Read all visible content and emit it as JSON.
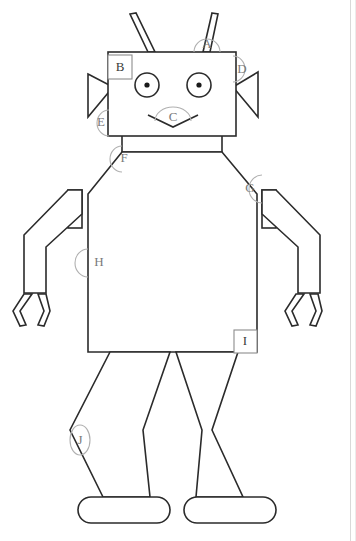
{
  "diagram": {
    "stroke_color": "#2b2b2b",
    "marker_color": "#7a7a7a",
    "background": "#ffffff",
    "markers": [
      {
        "id": "A",
        "label": "A",
        "shape": "semicircle",
        "part": "antenna",
        "cx": 207,
        "cy": 45,
        "r": 13
      },
      {
        "id": "B",
        "label": "B",
        "shape": "square",
        "part": "head",
        "x": 108,
        "y": 55,
        "w": 22,
        "h": 22
      },
      {
        "id": "C",
        "label": "C",
        "shape": "semicircle",
        "part": "mouth",
        "cx": 173,
        "cy": 120,
        "r": 13
      },
      {
        "id": "D",
        "label": "D",
        "shape": "semicircle",
        "part": "right-ear",
        "cx": 243,
        "cy": 81,
        "r": 12
      },
      {
        "id": "E",
        "label": "E",
        "shape": "semicircle",
        "part": "left-ear",
        "cx": 102,
        "cy": 122,
        "r": 12
      },
      {
        "id": "F",
        "label": "F",
        "shape": "semicircle",
        "part": "left-shoulder",
        "cx": 124,
        "cy": 157,
        "r": 12
      },
      {
        "id": "G",
        "label": "G",
        "shape": "semicircle",
        "part": "right-shoulder",
        "cx": 247,
        "cy": 188,
        "r": 13
      },
      {
        "id": "H",
        "label": "H",
        "shape": "semicircle",
        "part": "torso-left-edge",
        "cx": 99,
        "cy": 262,
        "r": 13
      },
      {
        "id": "I",
        "label": "I",
        "shape": "square",
        "part": "torso-bottom",
        "x": 234,
        "y": 330,
        "w": 22,
        "h": 22
      },
      {
        "id": "J",
        "label": "J",
        "shape": "oval",
        "part": "left-leg",
        "cx": 80,
        "cy": 440,
        "rx": 10,
        "ry": 15
      }
    ],
    "parts": [
      {
        "name": "antenna-left",
        "type": "polyline"
      },
      {
        "name": "antenna-right",
        "type": "polyline"
      },
      {
        "name": "head",
        "type": "rectangle"
      },
      {
        "name": "eye-left",
        "type": "circle-with-pupil"
      },
      {
        "name": "eye-right",
        "type": "circle-with-pupil"
      },
      {
        "name": "mouth",
        "type": "chevron"
      },
      {
        "name": "ear-left",
        "type": "triangle"
      },
      {
        "name": "ear-right",
        "type": "triangle"
      },
      {
        "name": "neck",
        "type": "rectangle"
      },
      {
        "name": "torso",
        "type": "polygon"
      },
      {
        "name": "arm-left",
        "type": "polygon"
      },
      {
        "name": "arm-right",
        "type": "polygon"
      },
      {
        "name": "hand-left",
        "type": "claw"
      },
      {
        "name": "hand-right",
        "type": "claw"
      },
      {
        "name": "leg-left",
        "type": "polygon"
      },
      {
        "name": "leg-right",
        "type": "polygon"
      },
      {
        "name": "foot-left",
        "type": "rounded-rectangle"
      },
      {
        "name": "foot-right",
        "type": "rounded-rectangle"
      }
    ]
  }
}
